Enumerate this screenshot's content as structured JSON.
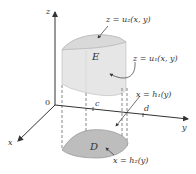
{
  "axes": {
    "z_label": "z",
    "y_label": "y",
    "x_label": "x",
    "origin_label": "0"
  },
  "ticks": {
    "c": "c",
    "d": "d"
  },
  "regions": {
    "solid_label": "E",
    "domain_label": "D"
  },
  "annotations": {
    "upper_surface": "z = u₂(x, y)",
    "lower_surface": "z = u₁(x, y)",
    "boundary_1": "x = h₁(y)",
    "boundary_2": "x = h₂(y)"
  },
  "colors": {
    "solid_fill": "#e4e4e4",
    "domain_fill": "#bdbdbd",
    "line": "#333333"
  }
}
